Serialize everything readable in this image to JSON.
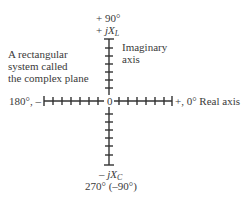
{
  "diagram": {
    "description_lines": [
      "A rectangular",
      "system called",
      "the complex plane"
    ],
    "top_labels": {
      "angle": "+ 90°",
      "sign": "+",
      "j": "j",
      "x": "X",
      "sub": "L"
    },
    "imaginary_axis_label": [
      "Imaginary",
      "axis"
    ],
    "left_label": "180°, –",
    "right_label": "+, 0° Real axis",
    "origin_label": "0",
    "bottom_labels": {
      "sign": "–",
      "j": "j",
      "x": "X",
      "sub": "C",
      "angle": "270° (–90°)"
    },
    "axis_color": "#333333",
    "ticks_per_half_axis": 7
  }
}
